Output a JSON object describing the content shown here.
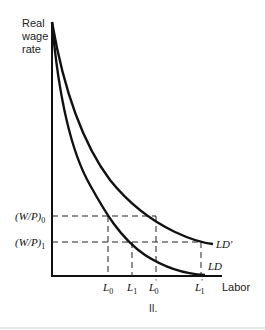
{
  "diagram": {
    "y_axis_label_lines": [
      "Real",
      "wage",
      "rate"
    ],
    "x_axis_label": "Labor",
    "caption": "II.",
    "curves": [
      {
        "name": "LD",
        "label": "LD"
      },
      {
        "name": "LD_prime",
        "label": "LD'"
      }
    ],
    "y_ticks": [
      {
        "label_main": "(W/P)",
        "label_sub": "0"
      },
      {
        "label_main": "(W/P)",
        "label_sub": "1"
      }
    ],
    "x_ticks": [
      {
        "label_main": "L",
        "label_sub": "0",
        "prime": ""
      },
      {
        "label_main": "L",
        "label_sub": "1",
        "prime": ""
      },
      {
        "label_main": "L",
        "label_sub": "0",
        "prime": "'"
      },
      {
        "label_main": "L",
        "label_sub": "1",
        "prime": "'"
      }
    ]
  }
}
